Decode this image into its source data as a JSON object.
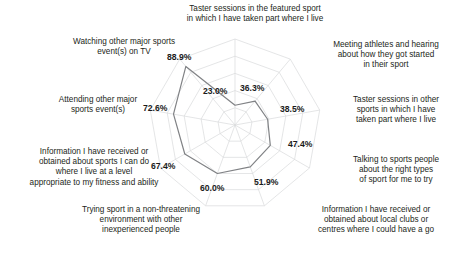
{
  "chart_data": {
    "type": "radar",
    "title": "",
    "subtitle": "",
    "xlabel": "",
    "ylabel": "",
    "grid": true,
    "legend": "none",
    "rings": 5,
    "rmin": 0,
    "rmax": 100,
    "units": "%",
    "categories": [
      "Taster sessions in the featured sport\nin which I have taken part where I live",
      "Meeting athletes and hearing\nabout how they got started\nin their sport",
      "Taster sessions in other\nsports in which I have\ntaken part where I live",
      "Talking to sports people\nabout the right types\nof sport for me to try",
      "Information I have received or\nobtained about local clubs or\ncentres where I could have a go",
      "Trying sport in a non-threatening\nenvironment with other\ninexperienced people",
      "Information I have received or\nobtained about sports I can do\nwhere I live at a level\nappropriate to my fitness and ability",
      "Attending other major\nsports event(s)",
      "Watching other major sports\nevent(s) on TV"
    ],
    "values": [
      23.0,
      36.3,
      38.5,
      47.4,
      51.9,
      60.0,
      67.4,
      72.6,
      88.9
    ],
    "value_labels": [
      "23.0%",
      "36.3%",
      "38.5%",
      "47.4%",
      "51.9%",
      "60.0%",
      "67.4%",
      "72.6%",
      "88.9%"
    ],
    "series": [
      {
        "name": "Percentage",
        "values": [
          23.0,
          36.3,
          38.5,
          47.4,
          51.9,
          60.0,
          67.4,
          72.6,
          88.9
        ]
      }
    ],
    "colors": {
      "series_line": "#808285",
      "grid": "#d9dadb",
      "text": "#231f20"
    }
  },
  "axis_labels": [
    {
      "text": "Taster sessions in the featured sport\nin which I have taken part where I live",
      "name": "axis-label-taster-featured"
    },
    {
      "text": "Meeting athletes and hearing\nabout how they got started\nin their sport",
      "name": "axis-label-meeting-athletes"
    },
    {
      "text": "Taster sessions in other\nsports in which I have\ntaken part where I live",
      "name": "axis-label-taster-other"
    },
    {
      "text": "Talking to sports people\nabout the right types\nof sport for me to try",
      "name": "axis-label-talking-sports-people"
    },
    {
      "text": "Information I have received or\nobtained about local clubs or\ncentres where I could have a go",
      "name": "axis-label-info-local-clubs"
    },
    {
      "text": "Trying sport in a non-threatening\nenvironment with other\ninexperienced people",
      "name": "axis-label-non-threatening"
    },
    {
      "text": "Information I have received or\nobtained about sports I can do\nwhere I live at a level\nappropriate to my fitness and ability",
      "name": "axis-label-info-sports-level"
    },
    {
      "text": "Attending other major\nsports event(s)",
      "name": "axis-label-attending-events"
    },
    {
      "text": "Watching other major sports\nevent(s) on TV",
      "name": "axis-label-watching-tv"
    }
  ],
  "value_labels": [
    {
      "text": "23.0%",
      "name": "value-label-taster-featured"
    },
    {
      "text": "36.3%",
      "name": "value-label-meeting-athletes"
    },
    {
      "text": "38.5%",
      "name": "value-label-taster-other"
    },
    {
      "text": "47.4%",
      "name": "value-label-talking-sports-people"
    },
    {
      "text": "51.9%",
      "name": "value-label-info-local-clubs"
    },
    {
      "text": "60.0%",
      "name": "value-label-non-threatening"
    },
    {
      "text": "67.4%",
      "name": "value-label-info-sports-level"
    },
    {
      "text": "72.6%",
      "name": "value-label-attending-events"
    },
    {
      "text": "88.9%",
      "name": "value-label-watching-tv"
    }
  ]
}
